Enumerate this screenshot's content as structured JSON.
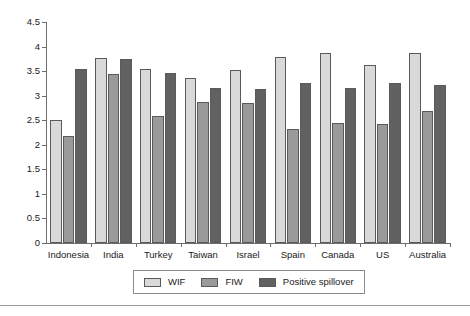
{
  "chart_data": {
    "type": "bar",
    "title": "",
    "subtitle": "",
    "xlabel": "",
    "ylabel": "",
    "categories": [
      "Indonesia",
      "India",
      "Turkey",
      "Taiwan",
      "Israel",
      "Spain",
      "Canada",
      "US",
      "Australia"
    ],
    "series": [
      {
        "name": "WIF",
        "color": "#d9d9d9",
        "values": [
          2.51,
          3.77,
          3.55,
          3.37,
          3.52,
          3.78,
          3.87,
          3.62,
          3.86
        ]
      },
      {
        "name": "FIW",
        "color": "#9a9a9a",
        "values": [
          2.18,
          3.44,
          2.59,
          2.88,
          2.85,
          2.32,
          2.45,
          2.42,
          2.68
        ]
      },
      {
        "name": "Positive spillover",
        "color": "#616161",
        "values": [
          3.54,
          3.74,
          3.46,
          3.15,
          3.13,
          3.25,
          3.15,
          3.26,
          3.22
        ]
      }
    ],
    "ylim": [
      0,
      4.5
    ],
    "ytick_values": [
      0,
      0.5,
      1,
      1.5,
      2,
      2.5,
      3,
      3.5,
      4,
      4.5
    ],
    "ytick_labels": [
      "0",
      "0.5",
      "1",
      "1.5",
      "2",
      "2.5",
      "3",
      "3.5",
      "4",
      "4.5"
    ],
    "grid": false,
    "legend_position": "bottom-center",
    "bar_border_color": "#5a5a5a",
    "axis_color": "#6e6e6e"
  }
}
